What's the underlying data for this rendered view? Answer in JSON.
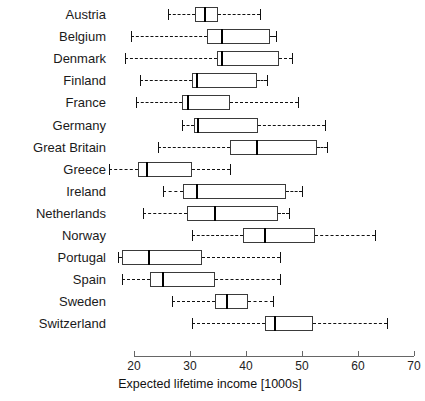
{
  "chart_data": {
    "type": "box",
    "title": "",
    "xlabel": "Expected lifetime income [1000s]",
    "ylabel": "",
    "xlim": [
      20,
      70
    ],
    "xticks": [
      20,
      30,
      40,
      50,
      60,
      70
    ],
    "xtick_labels": [
      "20",
      "30",
      "40",
      "50",
      "60",
      "70"
    ],
    "grid": false,
    "legend": "none",
    "orientation": "horizontal",
    "categories": [
      "Austria",
      "Belgium",
      "Denmark",
      "Finland",
      "France",
      "Germany",
      "Great Britain",
      "Greece",
      "Ireland",
      "Netherlands",
      "Norway",
      "Portugal",
      "Spain",
      "Sweden",
      "Switzerland"
    ],
    "boxes": [
      {
        "category": "Austria",
        "whisker_low": 26.1,
        "q1": 30.9,
        "median": 32.7,
        "q3": 35.0,
        "whisker_high": 42.5
      },
      {
        "category": "Belgium",
        "whisker_low": 19.5,
        "q1": 33.0,
        "median": 35.7,
        "q3": 44.3,
        "whisker_high": 45.4
      },
      {
        "category": "Denmark",
        "whisker_low": 18.4,
        "q1": 34.8,
        "median": 35.7,
        "q3": 45.9,
        "whisker_high": 48.2
      },
      {
        "category": "Finland",
        "whisker_low": 21.1,
        "q1": 30.4,
        "median": 31.3,
        "q3": 42.0,
        "whisker_high": 43.8
      },
      {
        "category": "France",
        "whisker_low": 20.4,
        "q1": 28.6,
        "median": 29.6,
        "q3": 37.1,
        "whisker_high": 49.3
      },
      {
        "category": "Germany",
        "whisker_low": 28.6,
        "q1": 30.7,
        "median": 31.4,
        "q3": 42.1,
        "whisker_high": 54.1
      },
      {
        "category": "Great Britain",
        "whisker_low": 24.3,
        "q1": 37.1,
        "median": 42.0,
        "q3": 52.7,
        "whisker_high": 54.5
      },
      {
        "category": "Greece",
        "whisker_low": 15.5,
        "q1": 20.7,
        "median": 22.3,
        "q3": 30.4,
        "whisker_high": 37.1
      },
      {
        "category": "Ireland",
        "whisker_low": 25.2,
        "q1": 28.8,
        "median": 31.3,
        "q3": 47.1,
        "whisker_high": 50.0
      },
      {
        "category": "Netherlands",
        "whisker_low": 21.6,
        "q1": 29.5,
        "median": 34.5,
        "q3": 45.7,
        "whisker_high": 47.7
      },
      {
        "category": "Norway",
        "whisker_low": 30.4,
        "q1": 39.5,
        "median": 43.4,
        "q3": 52.3,
        "whisker_high": 63.0
      },
      {
        "category": "Portugal",
        "whisker_low": 17.1,
        "q1": 17.9,
        "median": 22.7,
        "q3": 32.1,
        "whisker_high": 46.1
      },
      {
        "category": "Spain",
        "whisker_low": 17.9,
        "q1": 22.9,
        "median": 25.2,
        "q3": 34.5,
        "whisker_high": 46.1
      },
      {
        "category": "Sweden",
        "whisker_low": 26.8,
        "q1": 34.5,
        "median": 36.6,
        "q3": 40.4,
        "whisker_high": 44.8
      },
      {
        "category": "Switzerland",
        "whisker_low": 30.4,
        "q1": 43.4,
        "median": 45.2,
        "q3": 51.9,
        "whisker_high": 65.2
      }
    ],
    "colors": {
      "box_stroke": "#3a3a3a",
      "box_fill": "#ffffff",
      "median": "#000000",
      "whisker": "#111111",
      "axis": "#666666",
      "text": "#1a1a1a"
    }
  }
}
